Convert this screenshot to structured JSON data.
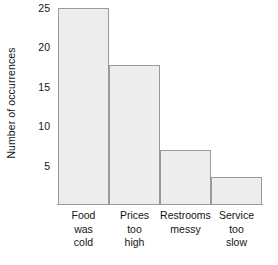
{
  "chart_data": {
    "type": "bar",
    "title": "",
    "subtitle": "",
    "xlabel": "",
    "ylabel": "Number of occurrences",
    "categories": [
      "Food was cold",
      "Prices too high",
      "Restrooms messy",
      "Service too slow"
    ],
    "category_lines": [
      [
        "Food",
        "was",
        "cold"
      ],
      [
        "Prices",
        "too",
        "high"
      ],
      [
        "Restrooms",
        "messy"
      ],
      [
        "Service",
        "too",
        "slow"
      ]
    ],
    "values": [
      25,
      17.8,
      7,
      3.5
    ],
    "ylim": [
      0,
      26
    ],
    "yticks": [
      5,
      10,
      15,
      20,
      25
    ],
    "ytick_labels": [
      "5",
      "10",
      "15",
      "20",
      "25"
    ],
    "grid": false,
    "legend": "none",
    "bar_fill": "#ededed",
    "bar_border": "#9a9a9a",
    "axis_color": "#9a9a9a",
    "text_color": "#141414",
    "background": "#ffffff"
  }
}
